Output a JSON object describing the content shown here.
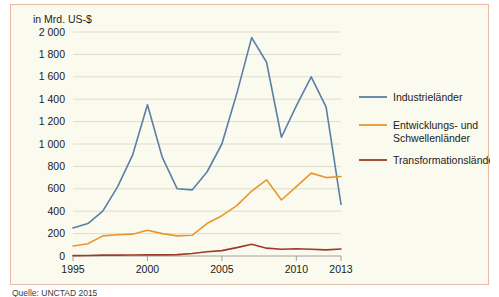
{
  "figure": {
    "axis_title": "in Mrd. US-$",
    "source_note": "Quelle: UNCTAD 2015"
  },
  "legend": {
    "items": [
      {
        "label": "Industrieländer",
        "color": "#5b7fa6"
      },
      {
        "label": "Entwicklungs- und Schwellenländer",
        "color": "#e8962e"
      },
      {
        "label": "Transformationsländer",
        "color": "#9e3b28"
      }
    ]
  },
  "chart_data": {
    "type": "line",
    "title": "",
    "subtitle": "",
    "xlabel": "",
    "ylabel": "in Mrd. US-$",
    "ylim": [
      0,
      2000
    ],
    "xlim": [
      1995,
      2013
    ],
    "grid": true,
    "legend_position": "right",
    "ytick_labels": [
      "0",
      "200",
      "400",
      "600",
      "800",
      "1 000",
      "1 200",
      "1 400",
      "1 600",
      "1 800",
      "2 000"
    ],
    "ytick_values": [
      0,
      200,
      400,
      600,
      800,
      1000,
      1200,
      1400,
      1600,
      1800,
      2000
    ],
    "xtick_labels": [
      "1995",
      "2000",
      "2005",
      "2010",
      "2013"
    ],
    "xtick_values": [
      1995,
      2000,
      2005,
      2010,
      2013
    ],
    "x": [
      1995,
      1996,
      1997,
      1998,
      1999,
      2000,
      2001,
      2002,
      2003,
      2004,
      2005,
      2006,
      2007,
      2008,
      2009,
      2010,
      2011,
      2012,
      2013
    ],
    "series": [
      {
        "name": "Industrieländer",
        "color": "#5b7fa6",
        "values": [
          250,
          290,
          400,
          620,
          900,
          1350,
          880,
          600,
          590,
          750,
          1000,
          1450,
          1950,
          1730,
          1060,
          1340,
          1600,
          1330,
          460
        ]
      },
      {
        "name": "Entwicklungs- und Schwellenländer",
        "color": "#e8962e",
        "values": [
          90,
          110,
          180,
          190,
          195,
          230,
          200,
          180,
          185,
          290,
          360,
          450,
          580,
          680,
          500,
          620,
          740,
          700,
          710
        ]
      },
      {
        "name": "Transformationsländer",
        "color": "#9e3b28",
        "values": [
          3,
          5,
          8,
          8,
          9,
          10,
          10,
          12,
          22,
          38,
          48,
          75,
          105,
          70,
          60,
          65,
          60,
          55,
          62
        ]
      }
    ]
  }
}
